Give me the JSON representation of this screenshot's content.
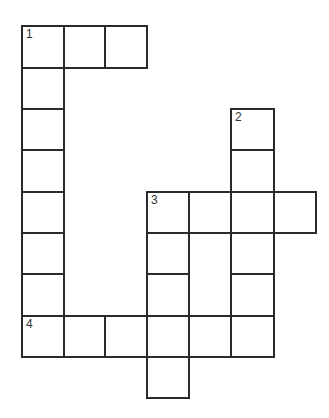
{
  "puzzle": {
    "type": "crossword",
    "colors": {
      "line": "#2a2a2a",
      "background": "#ffffff"
    },
    "col_edges": [
      22,
      64,
      105,
      147,
      189,
      231,
      274,
      316
    ],
    "row_edges": [
      26,
      68,
      109,
      150,
      192,
      233,
      274,
      316,
      357,
      398
    ],
    "cells": [
      {
        "r": 0,
        "c": 0,
        "n": "1"
      },
      {
        "r": 0,
        "c": 1
      },
      {
        "r": 0,
        "c": 2
      },
      {
        "r": 1,
        "c": 0
      },
      {
        "r": 2,
        "c": 0
      },
      {
        "r": 3,
        "c": 0
      },
      {
        "r": 4,
        "c": 0
      },
      {
        "r": 5,
        "c": 0
      },
      {
        "r": 6,
        "c": 0
      },
      {
        "r": 2,
        "c": 5,
        "n": "2"
      },
      {
        "r": 3,
        "c": 5
      },
      {
        "r": 4,
        "c": 3,
        "n": "3"
      },
      {
        "r": 4,
        "c": 4
      },
      {
        "r": 4,
        "c": 5
      },
      {
        "r": 4,
        "c": 6
      },
      {
        "r": 5,
        "c": 3
      },
      {
        "r": 5,
        "c": 5
      },
      {
        "r": 6,
        "c": 3
      },
      {
        "r": 6,
        "c": 5
      },
      {
        "r": 7,
        "c": 0,
        "n": "4"
      },
      {
        "r": 7,
        "c": 1
      },
      {
        "r": 7,
        "c": 2
      },
      {
        "r": 7,
        "c": 3
      },
      {
        "r": 7,
        "c": 4
      },
      {
        "r": 7,
        "c": 5
      },
      {
        "r": 8,
        "c": 3
      }
    ],
    "clue_numbers": [
      "1",
      "2",
      "3",
      "4"
    ]
  }
}
